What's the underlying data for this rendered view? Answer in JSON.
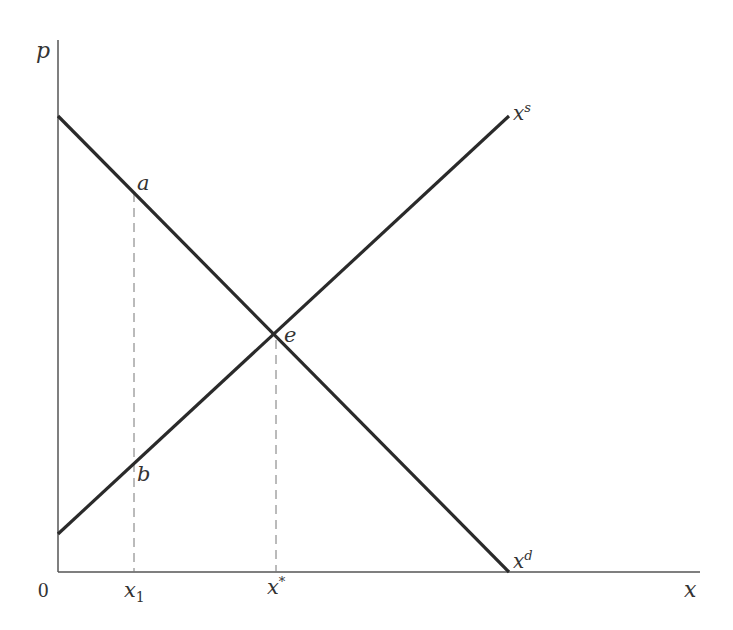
{
  "diagram": {
    "type": "supply-demand",
    "axes": {
      "y_label": "p",
      "x_label": "x",
      "origin_label": "0"
    },
    "curves": {
      "supply": {
        "label": "x",
        "label_sup": "s",
        "from": [
          58,
          534
        ],
        "to": [
          509,
          116
        ]
      },
      "demand": {
        "label": "x",
        "label_sup": "d",
        "from": [
          58,
          116
        ],
        "to": [
          509,
          572
        ]
      }
    },
    "points": {
      "a": "a",
      "b": "b",
      "e": "e"
    },
    "ticks": {
      "x1_main": "x",
      "x1_sub": "1",
      "xstar_main": "x",
      "xstar_sup": "*"
    },
    "colors": {
      "line": "#2a2a2a",
      "axis": "#555555",
      "dashed": "#777777",
      "text": "#333333"
    }
  }
}
